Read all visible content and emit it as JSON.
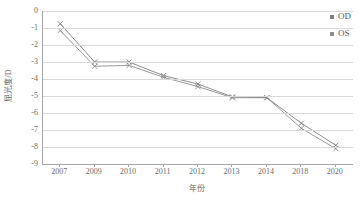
{
  "chart_data": {
    "type": "line",
    "title": "",
    "xlabel": "年份",
    "ylabel": "屈光度/D",
    "categories": [
      "2007",
      "2009",
      "2010",
      "2011",
      "2012",
      "2013",
      "2014",
      "2018",
      "2020"
    ],
    "series": [
      {
        "name": "OD",
        "color": "#808080",
        "marker": "x",
        "values": [
          -0.75,
          -3.0,
          -3.0,
          -3.8,
          -4.3,
          -5.05,
          -5.1,
          -6.6,
          -7.9
        ]
      },
      {
        "name": "OS",
        "color": "#8c8c8c",
        "marker": "x",
        "values": [
          -1.15,
          -3.25,
          -3.2,
          -3.9,
          -4.45,
          -5.1,
          -5.1,
          -6.9,
          -8.1
        ]
      }
    ],
    "ylim": [
      -9,
      0
    ],
    "ytick_values": [
      0,
      -1,
      -2,
      -3,
      -4,
      -5,
      -6,
      -7,
      -8,
      -9
    ],
    "ytick_labels": [
      "0",
      "-1",
      "-2",
      "-3",
      "-4",
      "-5",
      "-6",
      "-7",
      "-8",
      "-9"
    ],
    "grid": true,
    "grid_axis": "y",
    "legend_position": "top-right",
    "axis_color": "#a6a6a6",
    "grid_color": "#d9d9d9",
    "text_color": "#6b6b6b"
  },
  "legend": {
    "items": [
      {
        "label": "OD",
        "color": "#808080"
      },
      {
        "label": "OS",
        "color": "#8c8c8c"
      }
    ]
  }
}
